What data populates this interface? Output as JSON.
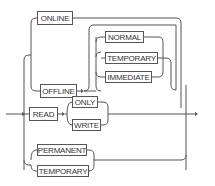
{
  "diagram": {
    "type": "railroad-syntax-diagram",
    "line_color": "#555555",
    "keywords": {
      "online": "ONLINE",
      "offline": "OFFLINE",
      "normal": "NORMAL",
      "temporary_offline": "TEMPORARY",
      "immediate": "IMMEDIATE",
      "read": "READ",
      "only": "ONLY",
      "write": "WRITE",
      "permanent": "PERMANENT",
      "temporary": "TEMPORARY"
    },
    "branches": [
      {
        "path": [
          "ONLINE"
        ]
      },
      {
        "path": [
          "OFFLINE",
          {
            "optional_choice": [
              "NORMAL",
              "TEMPORARY",
              "IMMEDIATE"
            ]
          }
        ]
      },
      {
        "path": [
          "READ",
          {
            "choice": [
              "ONLY",
              "WRITE"
            ]
          }
        ]
      },
      {
        "path": [
          {
            "choice": [
              "PERMANENT",
              "TEMPORARY"
            ]
          }
        ]
      }
    ]
  }
}
